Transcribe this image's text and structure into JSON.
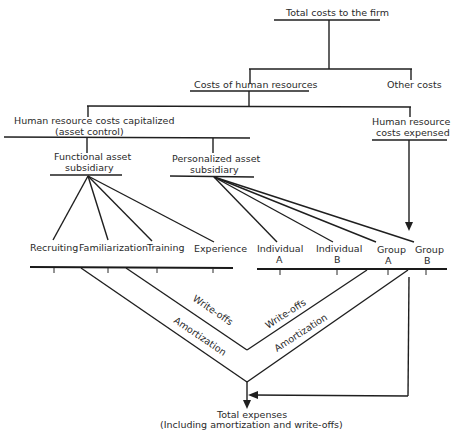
{
  "diagram": {
    "type": "flow-diagram",
    "nodes": {
      "total_costs": "Total costs to the firm",
      "hr_costs": "Costs of human resources",
      "other_costs": "Other costs",
      "hr_capitalized_line1": "Human resource costs capitalized",
      "hr_capitalized_line2": "(asset control)",
      "hr_expensed_line1": "Human resource",
      "hr_expensed_line2": "costs expensed",
      "functional_line1": "Functional asset",
      "functional_line2": "subsidiary",
      "personalized_line1": "Personalized asset",
      "personalized_line2": "subsidiary",
      "functional_accounts": [
        "Recruiting",
        "Familiarization",
        "Training",
        "Experience"
      ],
      "personalized_accounts": [
        {
          "line1": "Individual",
          "line2": "A"
        },
        {
          "line1": "Individual",
          "line2": "B"
        },
        {
          "line1": "Group",
          "line2": "A"
        },
        {
          "line1": "Group",
          "line2": "B"
        }
      ],
      "total_expenses_line1": "Total expenses",
      "total_expenses_line2": "(Including amortization and write-offs)"
    },
    "flow_labels": {
      "writeoffs_left": "Write-offs",
      "writeoffs_right": "Write-offs",
      "amortization_left": "Amortization",
      "amortization_right": "Amortization"
    },
    "edges": [
      {
        "from": "Total costs to the firm",
        "to": "Costs of human resources"
      },
      {
        "from": "Total costs to the firm",
        "to": "Other costs"
      },
      {
        "from": "Costs of human resources",
        "to": "Human resource costs capitalized"
      },
      {
        "from": "Costs of human resources",
        "to": "Human resource costs expensed"
      },
      {
        "from": "Human resource costs capitalized",
        "to": "Functional asset subsidiary"
      },
      {
        "from": "Human resource costs capitalized",
        "to": "Personalized asset subsidiary"
      },
      {
        "from": "Functional asset subsidiary",
        "to": "Recruiting"
      },
      {
        "from": "Functional asset subsidiary",
        "to": "Familiarization"
      },
      {
        "from": "Functional asset subsidiary",
        "to": "Training"
      },
      {
        "from": "Functional asset subsidiary",
        "to": "Experience"
      },
      {
        "from": "Personalized asset subsidiary",
        "to": "Individual A"
      },
      {
        "from": "Personalized asset subsidiary",
        "to": "Individual B"
      },
      {
        "from": "Personalized asset subsidiary",
        "to": "Group A"
      },
      {
        "from": "Personalized asset subsidiary",
        "to": "Group B"
      },
      {
        "from": "Human resource costs expensed",
        "to": "Group B",
        "arrow": true
      },
      {
        "from": "Functional ledger",
        "to": "Total expenses",
        "label": "Amortization"
      },
      {
        "from": "Functional ledger",
        "to": "Write-offs junction",
        "label": "Write-offs"
      },
      {
        "from": "Personalized ledger",
        "to": "Write-offs junction",
        "label": "Write-offs"
      },
      {
        "from": "Personalized ledger",
        "to": "Total expenses",
        "label": "Amortization"
      },
      {
        "from": "Human resource costs expensed",
        "to": "Total expenses",
        "arrow": true
      }
    ]
  }
}
